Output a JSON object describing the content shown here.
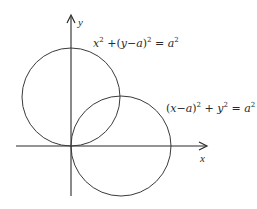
{
  "diagram": {
    "type": "math-figure",
    "axes": {
      "x_label": "x",
      "y_label": "y"
    },
    "curves": [
      {
        "name": "upper circle",
        "equation_text": "x^2 + (y - a)^2 = a^2",
        "center": "(0, a)",
        "radius": "a"
      },
      {
        "name": "lower-right circle",
        "equation_text": "(x - a)^2 + y^2 = a^2",
        "center": "(a, 0)",
        "radius": "a"
      }
    ],
    "labels": {
      "eq1": {
        "x": "x",
        "sup1": "2",
        "plus": "+",
        "lparen": "(",
        "y": "y",
        "minus": "−",
        "a": "a",
        "rparen": ")",
        "sup2": "2",
        "equals": "=",
        "a2": "a",
        "sup3": "2"
      },
      "eq2": {
        "lparen": "(",
        "x": "x",
        "minus": "−",
        "a": "a",
        "rparen": ")",
        "sup1": "2",
        "plus": "+",
        "y": "y",
        "sup2": "2",
        "equals": "=",
        "a2": "a",
        "sup3": "2"
      }
    },
    "colors": {
      "stroke": "#2a2a2a",
      "background": "#ffffff"
    }
  }
}
